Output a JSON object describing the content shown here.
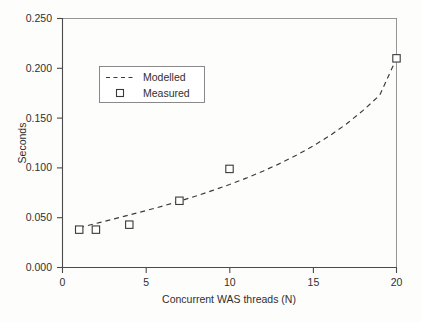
{
  "chart_data": {
    "type": "scatter",
    "title": "",
    "xlabel": "Concurrent WAS threads (N)",
    "ylabel": "Seconds",
    "xlim": [
      0,
      20
    ],
    "ylim": [
      0.0,
      0.25
    ],
    "grid": false,
    "legend_position": "upper-left-inside",
    "x_ticks": [
      0,
      5,
      10,
      15,
      20
    ],
    "x_tick_labels": [
      "0",
      "5",
      "10",
      "15",
      "20"
    ],
    "y_ticks": [
      0.0,
      0.05,
      0.1,
      0.15,
      0.2,
      0.25
    ],
    "y_tick_labels": [
      "0.000",
      "0.050",
      "0.100",
      "0.150",
      "0.200",
      "0.250"
    ],
    "series": [
      {
        "name": "Modelled",
        "type": "line",
        "style": "dashed",
        "x": [
          1,
          2,
          3,
          4,
          5,
          6,
          7,
          8,
          9,
          10,
          11,
          12,
          13,
          14,
          15,
          16,
          17,
          18,
          19,
          20
        ],
        "values": [
          0.04,
          0.0442,
          0.0484,
          0.0527,
          0.0571,
          0.0617,
          0.0666,
          0.0718,
          0.0774,
          0.0833,
          0.0897,
          0.0967,
          0.1043,
          0.1126,
          0.1219,
          0.1323,
          0.1441,
          0.1577,
          0.1731,
          0.21
        ]
      },
      {
        "name": "Measured",
        "type": "scatter",
        "marker": "open-square",
        "x": [
          1,
          2,
          4,
          7,
          10,
          20
        ],
        "values": [
          0.038,
          0.038,
          0.043,
          0.067,
          0.099,
          0.21
        ]
      }
    ]
  },
  "legend": {
    "entries": [
      {
        "label": "Modelled",
        "marker": "dashed-line"
      },
      {
        "label": "Measured",
        "marker": "open-square"
      }
    ]
  },
  "axes": {
    "y_title": "Seconds",
    "x_title": "Concurrent WAS threads (N)"
  },
  "colors": {
    "background": "#fdfdfc",
    "axis": "#4a4a4a",
    "frame": "#8a8a8a",
    "series": "#3a3a3a",
    "text": "#2f2f2f"
  }
}
